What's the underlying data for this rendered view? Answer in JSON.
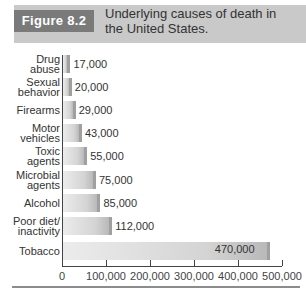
{
  "figure": {
    "tag": "Figure 8.2",
    "caption": "Underlying causes of death in the United States."
  },
  "chart_data": {
    "type": "bar",
    "orientation": "horizontal",
    "title": "Underlying causes of death in the United States.",
    "xlabel": "",
    "ylabel": "",
    "xlim": [
      0,
      500000
    ],
    "grid": false,
    "categories": [
      "Drug\nabuse",
      "Sexual\nbehavior",
      "Firearms",
      "Motor\nvehicles",
      "Toxic\nagents",
      "Microbial\nagents",
      "Alcohol",
      "Poor diet/\ninactivity",
      "Tobacco"
    ],
    "values": [
      17000,
      20000,
      29000,
      43000,
      55000,
      75000,
      85000,
      112000,
      470000
    ],
    "value_labels": [
      "17,000",
      "20,000",
      "29,000",
      "43,000",
      "55,000",
      "75,000",
      "85,000",
      "112,000",
      "470,000"
    ],
    "x_ticks": [
      "0",
      "100,000",
      "200,000",
      "300,000",
      "400,000",
      "500,000"
    ],
    "x_tick_values": [
      0,
      100000,
      200000,
      300000,
      400000,
      500000
    ]
  }
}
